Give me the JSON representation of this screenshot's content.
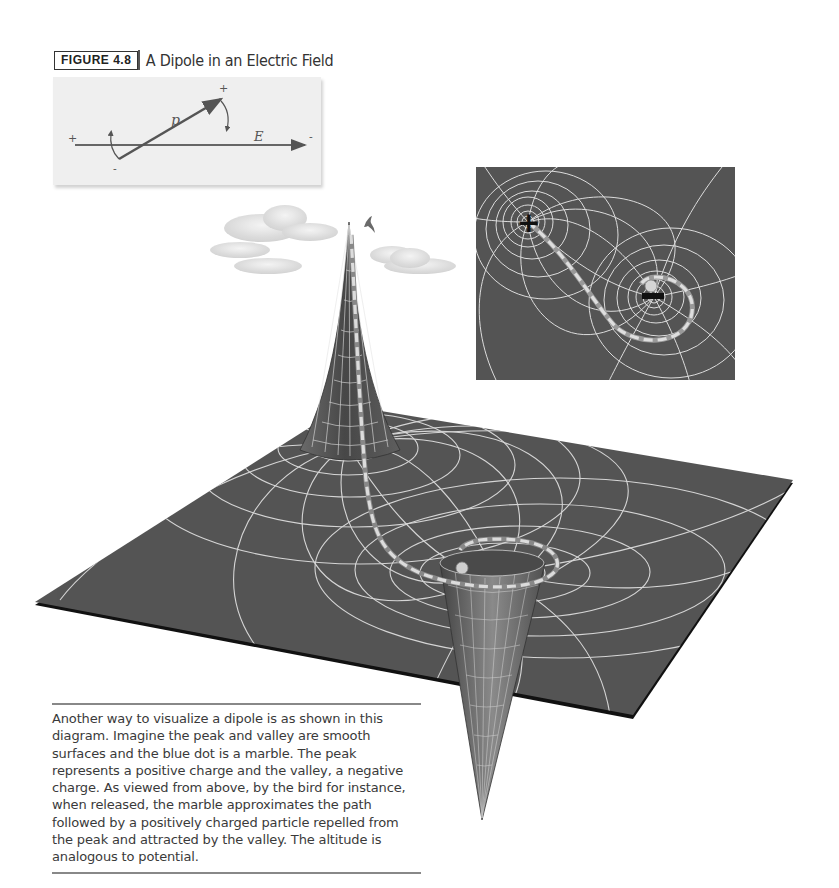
{
  "figure": {
    "tag": "FIGURE 4.8",
    "title": "A Dipole in an Electric Field"
  },
  "dipole_panel": {
    "dipole_label": "p",
    "field_label": "E",
    "field_start_sign": "+",
    "field_end_sign": "-",
    "dipole_head_sign": "+",
    "dipole_tail_sign": "-"
  },
  "inset_map": {
    "positive_charge_symbol": "+",
    "negative_charge_symbol": "−"
  },
  "caption": {
    "text": "Another way to visualize a dipole is as shown in this diagram. Imagine the peak and valley are smooth surfaces and the blue dot is a marble. The peak represents a positive charge and the valley, a negative charge. As viewed from above, by the bird for instance, when released, the marble approximates the path followed by a positively charged particle repelled from the peak and attracted by the valley. The altitude is analogous to potential."
  },
  "colors": {
    "plane": "#555555",
    "grid": "#e6e6e6",
    "path_dash": "#d9d9d9",
    "panel_bg": "#efefef",
    "inset_bg": "#545454"
  }
}
